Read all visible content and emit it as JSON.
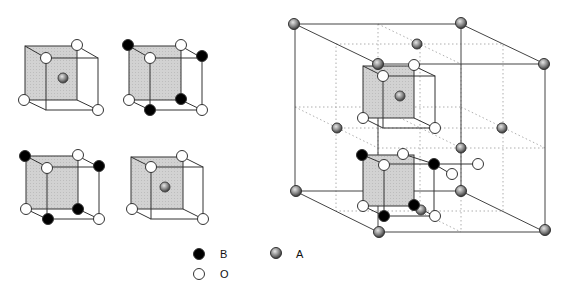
{
  "figure": {
    "colors": {
      "B_atom": "#000000",
      "O_atom": "#ffffff",
      "A_atom": "#8a8a8a",
      "shaded_face": "#d4d4d4",
      "edge": "#333333",
      "dotted": "#9a9a9a"
    }
  },
  "legend": {
    "items": [
      {
        "symbol": "black-filled-circle",
        "label": "B"
      },
      {
        "symbol": "gray-sphere",
        "label": "A"
      },
      {
        "symbol": "open-circle",
        "label": "O"
      }
    ]
  }
}
